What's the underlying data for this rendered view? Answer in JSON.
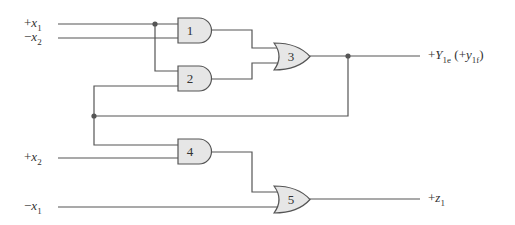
{
  "diagram": {
    "type": "logic-circuit",
    "colors": {
      "wire": "#555555",
      "gate_fill": "#e6e6e6",
      "gate_stroke": "#555555",
      "junction": "#555555"
    },
    "inputs": [
      {
        "id": "in_x1_pos",
        "sign": "+",
        "var": "x",
        "sub": "1",
        "y": 24
      },
      {
        "id": "in_x2_neg",
        "sign": "−",
        "var": "x",
        "sub": "2",
        "y": 38
      },
      {
        "id": "in_x2_pos",
        "sign": "+",
        "var": "x",
        "sub": "2",
        "y": 158
      },
      {
        "id": "in_x1_neg",
        "sign": "−",
        "var": "x",
        "sub": "1",
        "y": 207
      }
    ],
    "outputs": [
      {
        "id": "out_Y",
        "sign": "+",
        "var": "Y",
        "sub": "1e",
        "extra_open": " (+",
        "extra_var": "y",
        "extra_sub": "1f",
        "extra_close": ")",
        "y": 56
      },
      {
        "id": "out_z",
        "sign": "+",
        "var": "z",
        "sub": "1",
        "y": 199
      }
    ],
    "gates": [
      {
        "id": "1",
        "kind": "AND",
        "label": "1"
      },
      {
        "id": "2",
        "kind": "AND",
        "label": "2"
      },
      {
        "id": "3",
        "kind": "OR",
        "label": "3"
      },
      {
        "id": "4",
        "kind": "AND",
        "label": "4"
      },
      {
        "id": "5",
        "kind": "OR",
        "label": "5"
      }
    ]
  }
}
